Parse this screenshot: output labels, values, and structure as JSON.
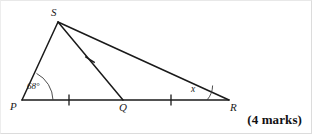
{
  "figure": {
    "type": "geometry-diagram",
    "vertices": [
      {
        "id": "S",
        "label": "S",
        "x": 57,
        "y": 21
      },
      {
        "id": "P",
        "label": "P",
        "x": 21,
        "y": 99
      },
      {
        "id": "Q",
        "label": "Q",
        "x": 122,
        "y": 99
      },
      {
        "id": "R",
        "label": "R",
        "x": 228,
        "y": 99
      }
    ],
    "segments": [
      {
        "id": "PS",
        "from": "P",
        "to": "S"
      },
      {
        "id": "SQ",
        "from": "S",
        "to": "Q"
      },
      {
        "id": "SR",
        "from": "S",
        "to": "R"
      },
      {
        "id": "PR",
        "from": "P",
        "to": "R"
      }
    ],
    "tick_marks": [
      {
        "id": "tick-pq",
        "on": "PQ",
        "x": 68,
        "y": 99,
        "count": 1
      },
      {
        "id": "tick-qr",
        "on": "QR",
        "x": 170,
        "y": 99,
        "count": 1
      },
      {
        "id": "tick-sq",
        "on": "SQ",
        "x": 89,
        "y": 59,
        "count": 1
      }
    ],
    "angles": [
      {
        "id": "angle-P",
        "at": "P",
        "label": "68°",
        "value": 68,
        "unit": "degrees"
      },
      {
        "id": "angle-R",
        "at": "R",
        "label": "x",
        "value": null,
        "unit": "unknown"
      }
    ],
    "marks_note": "(4 marks)",
    "colors": {
      "stroke": "#1a1a1a",
      "text": "#1a1a1a",
      "background": "#ffffff",
      "frame_border": "#dcdcdc"
    }
  }
}
